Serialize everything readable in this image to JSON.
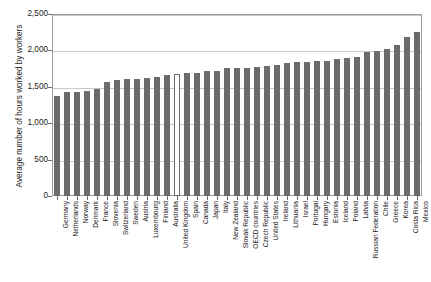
{
  "chart_data": {
    "type": "bar",
    "title": "",
    "subtitle": "",
    "xlabel": "",
    "ylabel": "Average number of hours worked by workers",
    "ylim": [
      0,
      2500
    ],
    "ytick_values": [
      0,
      500,
      1000,
      1500,
      2000,
      2500
    ],
    "ytick_labels": [
      "0",
      "500",
      "1,000",
      "1,500",
      "2,000",
      "2,500"
    ],
    "grid": "horizontal",
    "legend": "none",
    "bar_color": "#6b6b6b",
    "highlight_color": "#ffffff",
    "highlight_category": "United Kingdom",
    "categories": [
      "Germany",
      "Netherlands",
      "Norway",
      "Denmark",
      "France",
      "Slovenia",
      "Switzerland",
      "Sweden",
      "Austria",
      "Luxembourg",
      "Finland",
      "Australia",
      "United Kingdom",
      "Spain",
      "Canada",
      "Japan",
      "Italy",
      "New Zealand",
      "Slovak Republic",
      "OECD countries",
      "Czech Republic",
      "United States",
      "Ireland",
      "Lithuania",
      "Israel",
      "Portugal",
      "Hungary",
      "Estonia",
      "Iceland",
      "Poland",
      "Latvia",
      "Russian Federation",
      "Chile",
      "Greece",
      "Korea",
      "Costa Rica",
      "Mexico"
    ],
    "values": [
      1371,
      1430,
      1424,
      1438,
      1472,
      1561,
      1590,
      1609,
      1613,
      1617,
      1628,
      1669,
      1670,
      1687,
      1695,
      1713,
      1723,
      1752,
      1763,
      1765,
      1770,
      1786,
      1796,
      1831,
      1835,
      1842,
      1848,
      1855,
      1883,
      1895,
      1910,
      1972,
      1988,
      2018,
      2069,
      2179,
      2255
    ]
  }
}
